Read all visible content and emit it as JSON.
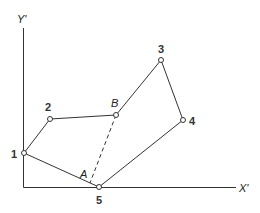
{
  "diagram": {
    "axes": {
      "y_label": "Y'",
      "x_label": "X'"
    },
    "vertices": [
      {
        "id": "1",
        "label": "1",
        "x": 24,
        "y": 153
      },
      {
        "id": "2",
        "label": "2",
        "x": 50,
        "y": 119
      },
      {
        "id": "B",
        "label": "B",
        "x": 116,
        "y": 115
      },
      {
        "id": "3",
        "label": "3",
        "x": 161,
        "y": 60
      },
      {
        "id": "4",
        "label": "4",
        "x": 183,
        "y": 120
      },
      {
        "id": "5",
        "label": "5",
        "x": 99,
        "y": 187
      }
    ],
    "polygon_order": [
      "1",
      "2",
      "B",
      "3",
      "4",
      "5"
    ],
    "points": {
      "A": {
        "label": "A"
      },
      "B": {
        "label": "B"
      }
    },
    "dashed_segment": {
      "from": "B",
      "to": "A"
    },
    "colors": {
      "line": "#333333",
      "background": "#ffffff"
    }
  }
}
